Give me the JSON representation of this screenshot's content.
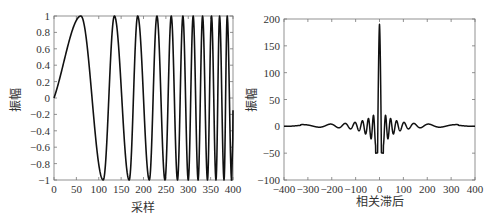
{
  "chart_data": [
    {
      "type": "line",
      "title": "",
      "description": "Linear frequency modulated (chirp) signal",
      "xlabel": "采样",
      "ylabel": "振幅",
      "xlim": [
        0,
        400
      ],
      "ylim": [
        -1,
        1
      ],
      "xticks": [
        0,
        50,
        100,
        150,
        200,
        250,
        300,
        350,
        400
      ],
      "yticks": [
        1,
        0.8,
        0.6,
        0.4,
        0.2,
        0,
        -0.2,
        -0.4,
        -0.6,
        -0.8,
        -1
      ],
      "xtick_labels": [
        "0",
        "50",
        "100",
        "150",
        "200",
        "250",
        "300",
        "350",
        "400"
      ],
      "ytick_labels": [
        "1",
        "0.8",
        "0.6",
        "0.4",
        "0.2",
        "0",
        "−0.2",
        "−0.4",
        "−0.6",
        "−0.8",
        "−1"
      ],
      "grid": false,
      "legend": null,
      "series": [
        {
          "name": "chirp",
          "formula": "sin(2*pi*k*n^2) with phase offset, starting at 0, first peak ~n=60, minima near 110,170,215,248,275,300,322,343,362,380,397",
          "peaks_x": [
            60,
            135,
            187,
            230,
            262,
            288,
            311,
            332,
            352,
            370,
            387
          ],
          "troughs_x": [
            110,
            168,
            213,
            248,
            276,
            300,
            322,
            343,
            362,
            380,
            397
          ],
          "start": [
            0,
            0
          ],
          "end": [
            400,
            -0.15
          ]
        }
      ]
    },
    {
      "type": "line",
      "title": "",
      "description": "Autocorrelation of the chirp signal",
      "xlabel": "相关滞后",
      "ylabel": "振幅",
      "xlim": [
        -400,
        400
      ],
      "ylim": [
        -100,
        200
      ],
      "xticks": [
        -400,
        -300,
        -200,
        -100,
        0,
        100,
        200,
        300,
        400
      ],
      "yticks": [
        200,
        150,
        100,
        50,
        0,
        -50,
        -100
      ],
      "xtick_labels": [
        "−400",
        "−300",
        "−200",
        "−100",
        "0",
        "100",
        "200",
        "300",
        "400"
      ],
      "ytick_labels": [
        "200",
        "150",
        "100",
        "50",
        "0",
        "−50",
        "−100"
      ],
      "grid": false,
      "legend": null,
      "series": [
        {
          "name": "autocorrelation",
          "peak": [
            0,
            190
          ],
          "first_minima": [
            [
              -12,
              -50
            ],
            [
              12,
              -50
            ]
          ],
          "second_peaks": [
            [
              -25,
              18
            ],
            [
              25,
              18
            ]
          ],
          "sidelobe_amplitude_range": [
            -20,
            12
          ],
          "tails": [
            [
              -400,
              0
            ],
            [
              400,
              0
            ]
          ]
        }
      ]
    }
  ],
  "left_chart": {
    "ylabel": "振幅",
    "xlabel": "采样",
    "xticks": [
      "0",
      "50",
      "100",
      "150",
      "200",
      "250",
      "300",
      "350",
      "400"
    ],
    "yticks": [
      "1",
      "0.8",
      "0.6",
      "0.4",
      "0.2",
      "0",
      "−0.2",
      "−0.4",
      "−0.6",
      "−0.8",
      "−1"
    ]
  },
  "right_chart": {
    "ylabel": "振幅",
    "xlabel": "相关滞后",
    "xticks": [
      "−400",
      "−300",
      "−200",
      "−100",
      "0",
      "100",
      "200",
      "300",
      "400"
    ],
    "yticks": [
      "200",
      "150",
      "100",
      "50",
      "0",
      "−50",
      "−100"
    ]
  },
  "colors": {
    "line": "#111111",
    "axis": "#555555",
    "text": "#333333"
  }
}
